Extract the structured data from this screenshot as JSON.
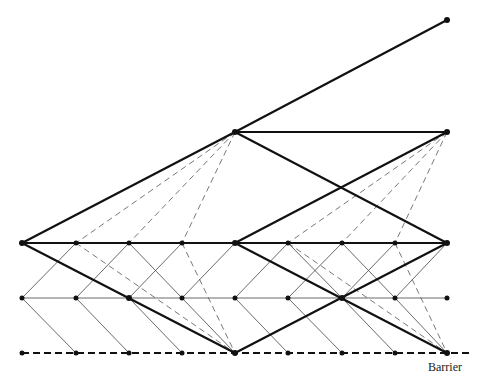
{
  "diagram": {
    "type": "trinomial lattice with barrier",
    "barrier_label": "Barrier",
    "columns_x": [
      22,
      76,
      129,
      182,
      235,
      288,
      342,
      395,
      447
    ],
    "rows_y": {
      "upper": 243,
      "middle": 298,
      "lower": 353
    },
    "coarse_nodes": [
      [
        22,
        243
      ],
      [
        235,
        132
      ],
      [
        235,
        243
      ],
      [
        235,
        353
      ],
      [
        447,
        20
      ],
      [
        447,
        132
      ],
      [
        447,
        243
      ],
      [
        447,
        353
      ]
    ]
  }
}
